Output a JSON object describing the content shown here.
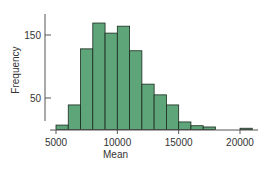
{
  "chart_data": {
    "type": "bar",
    "title": "",
    "xlabel": "Mean",
    "ylabel": "Frequency",
    "bin_width": 1000,
    "bins": [
      {
        "start": 5000,
        "end": 6000,
        "count": 7
      },
      {
        "start": 6000,
        "end": 7000,
        "count": 39
      },
      {
        "start": 7000,
        "end": 8000,
        "count": 128
      },
      {
        "start": 8000,
        "end": 9000,
        "count": 169
      },
      {
        "start": 9000,
        "end": 10000,
        "count": 153
      },
      {
        "start": 10000,
        "end": 11000,
        "count": 164
      },
      {
        "start": 11000,
        "end": 12000,
        "count": 125
      },
      {
        "start": 12000,
        "end": 13000,
        "count": 72
      },
      {
        "start": 13000,
        "end": 14000,
        "count": 55
      },
      {
        "start": 14000,
        "end": 15000,
        "count": 39
      },
      {
        "start": 15000,
        "end": 16000,
        "count": 12
      },
      {
        "start": 16000,
        "end": 17000,
        "count": 6
      },
      {
        "start": 17000,
        "end": 18000,
        "count": 4
      },
      {
        "start": 20000,
        "end": 21000,
        "count": 2
      }
    ],
    "x_ticks": [
      5000,
      10000,
      15000,
      20000
    ],
    "y_ticks": [
      50,
      150
    ],
    "xlim": [
      5000,
      21000
    ],
    "ylim": [
      0,
      180
    ],
    "grid": false,
    "legend": null,
    "bar_color": "#5fa57a",
    "edge_color": "#1a2a1f"
  }
}
